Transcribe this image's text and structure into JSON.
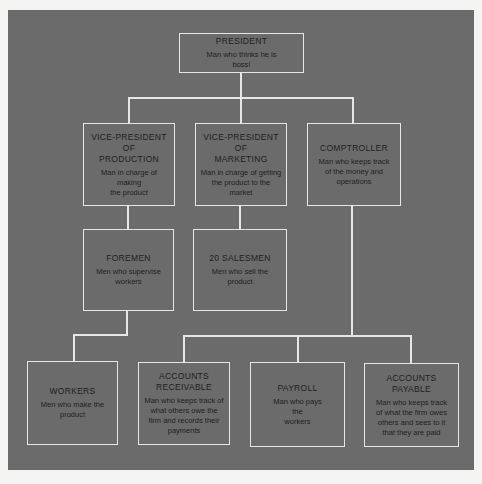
{
  "chart": {
    "type": "organization-chart",
    "nodes": {
      "president": {
        "title": "PRESIDENT",
        "desc": "Man who thinks he is\nboss!"
      },
      "vp_production": {
        "title": "VICE-PRESIDENT\nOF\nPRODUCTION",
        "desc": "Man in charge of making\nthe product"
      },
      "vp_marketing": {
        "title": "VICE-PRESIDENT\nOF\nMARKETING",
        "desc": "Man in charge of getting\nthe product to the\nmarket"
      },
      "comptroller": {
        "title": "COMPTROLLER",
        "desc": "Man who keeps track\nof the money and\noperations"
      },
      "foremen": {
        "title": "FOREMEN",
        "desc": "Men who supervise\nworkers"
      },
      "salesmen": {
        "title": "20 SALESMEN",
        "desc": "Men who sell the\nproduct"
      },
      "workers": {
        "title": "WORKERS",
        "desc": "Men who make the\nproduct"
      },
      "accounts_receivable": {
        "title": "ACCOUNTS\nRECEIVABLE",
        "desc": "Man who keeps track of\nwhat others owe the\nfirm and records their\npayments"
      },
      "payroll": {
        "title": "PAYROLL",
        "desc": "Man who pays\nthe\nworkers"
      },
      "accounts_payable": {
        "title": "ACCOUNTS PAYABLE",
        "desc": "Man who keeps track\nof what the firm owes\nothers and sees to it\nthat they are paid"
      }
    },
    "edges": [
      [
        "president",
        "vp_production"
      ],
      [
        "president",
        "vp_marketing"
      ],
      [
        "president",
        "comptroller"
      ],
      [
        "vp_production",
        "foremen"
      ],
      [
        "vp_marketing",
        "salesmen"
      ],
      [
        "foremen",
        "workers"
      ],
      [
        "comptroller",
        "accounts_receivable"
      ],
      [
        "comptroller",
        "payroll"
      ],
      [
        "comptroller",
        "accounts_payable"
      ]
    ]
  },
  "colors": {
    "background": "#6b6b6b",
    "lines": "#e6e6e6",
    "text": "#1e1e1e"
  }
}
